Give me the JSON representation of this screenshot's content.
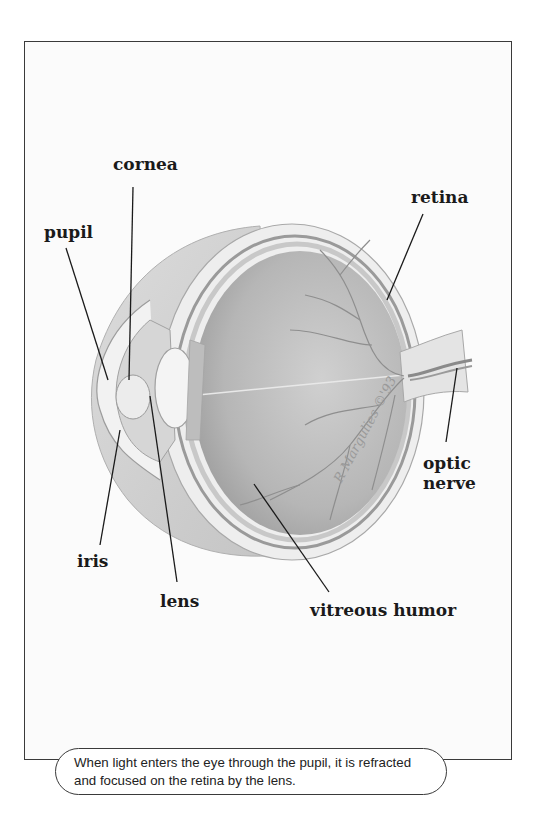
{
  "figure": {
    "labels": {
      "cornea": "cornea",
      "pupil": "pupil",
      "retina": "retina",
      "optic_nerve_line1": "optic",
      "optic_nerve_line2": "nerve",
      "iris": "iris",
      "lens": "lens",
      "vitreous_humor": "vitreous humor"
    },
    "signature": "R Margulies ©'93",
    "caption": "When light enters the eye through the pupil, it is refracted and focused on the retina by the lens."
  },
  "colors": {
    "frame_border": "#3a3a3a",
    "label_text": "#1a1a1a",
    "eye_interior": "#b9b9b9",
    "sclera": "#e6e6e6",
    "vessels": "#8a8a8a"
  }
}
